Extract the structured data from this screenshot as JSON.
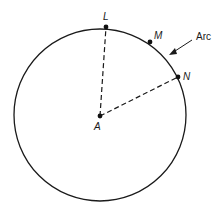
{
  "diagram": {
    "type": "circle-geometry",
    "circle": {
      "cx": 100,
      "cy": 115,
      "r": 86,
      "stroke": "#1a1a1a"
    },
    "center": {
      "label": "A",
      "x": 100,
      "y": 116
    },
    "points": [
      {
        "label": "L",
        "x": 106,
        "y": 27
      },
      {
        "label": "M",
        "x": 150,
        "y": 42
      },
      {
        "label": "N",
        "x": 178,
        "y": 77
      }
    ],
    "radii": [
      {
        "from": "A",
        "to": "L",
        "style": "dashed"
      },
      {
        "from": "A",
        "to": "N",
        "style": "dashed"
      }
    ],
    "annotation": {
      "text": "Arc",
      "points_to": "arc LN between M and N"
    }
  }
}
